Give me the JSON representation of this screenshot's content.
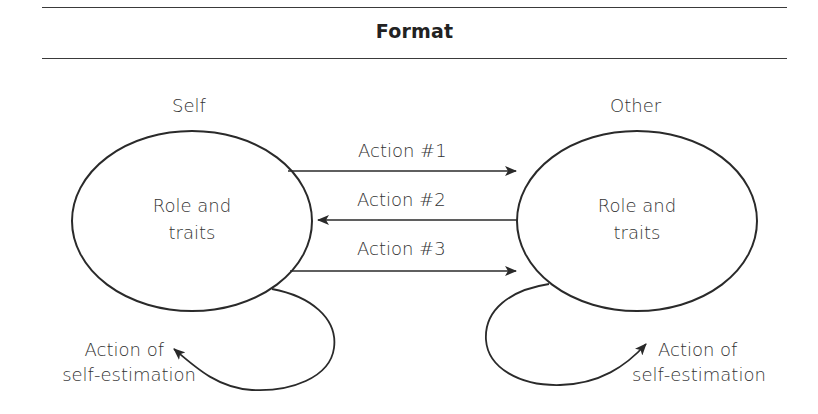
{
  "header": {
    "title": "Format"
  },
  "nodes": {
    "self": {
      "heading": "Self",
      "content_line1": "Role and",
      "content_line2": "traits"
    },
    "other": {
      "heading": "Other",
      "content_line1": "Role and",
      "content_line2": "traits"
    }
  },
  "edges": [
    {
      "label": "Action #1",
      "from": "Self",
      "to": "Other"
    },
    {
      "label": "Action #2",
      "from": "Other",
      "to": "Self"
    },
    {
      "label": "Action #3",
      "from": "Self",
      "to": "Other"
    }
  ],
  "self_loops": {
    "self": {
      "line1": "Action of",
      "line2": "self-estimation"
    },
    "other": {
      "line1": "Action of",
      "line2": "self-estimation"
    }
  },
  "colors": {
    "stroke": "#2a2a2a",
    "text": "#333333",
    "background": "#ffffff"
  }
}
